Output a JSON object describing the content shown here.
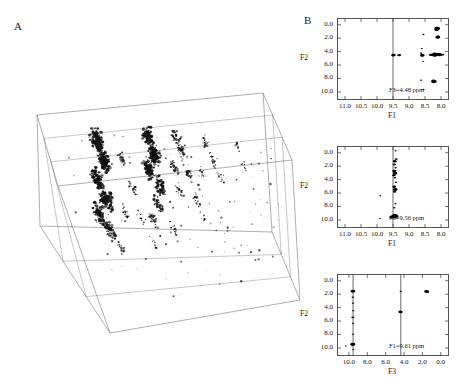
{
  "figure": {
    "panel_a_letter": "A",
    "panel_b_letter": "B"
  },
  "panelA": {
    "name": "3d-nmr-spectrum-cube",
    "description": "Three-dimensional NMR spectrum displayed as a perspective wireframe box with contour peak clusters"
  },
  "chart_data": [
    {
      "type": "scatter",
      "id": "plane-f3-4.48",
      "title": "F3=4.48 ppm",
      "xlabel": "F1",
      "ylabel": "F2",
      "xticks": [
        "11.0",
        "10.5",
        "10.0",
        "9.5",
        "9.0",
        "8.5",
        "8.0"
      ],
      "yticks": [
        "0.0",
        "2.0",
        "4.0",
        "6.0",
        "8.0",
        "10.0"
      ],
      "xlim": [
        11.25,
        7.75
      ],
      "ylim": [
        -1.0,
        11.2
      ],
      "grid": false,
      "vlines": [
        9.5
      ],
      "points": [
        {
          "x": 8.12,
          "y": 0.55,
          "s": 5.0
        },
        {
          "x": 8.14,
          "y": 0.75,
          "s": 4.2
        },
        {
          "x": 8.1,
          "y": 1.85,
          "s": 4.6
        },
        {
          "x": 8.55,
          "y": 1.45,
          "s": 2.0
        },
        {
          "x": 8.6,
          "y": 3.55,
          "s": 2.2
        },
        {
          "x": 8.62,
          "y": 4.25,
          "s": 2.4
        },
        {
          "x": 8.58,
          "y": 4.55,
          "s": 4.2
        },
        {
          "x": 8.56,
          "y": 5.45,
          "s": 2.0
        },
        {
          "x": 8.2,
          "y": 4.45,
          "s": 5.6
        },
        {
          "x": 8.05,
          "y": 4.45,
          "s": 5.0
        },
        {
          "x": 8.32,
          "y": 4.48,
          "s": 3.4
        },
        {
          "x": 7.95,
          "y": 4.45,
          "s": 3.0
        },
        {
          "x": 9.48,
          "y": 4.52,
          "s": 4.0
        },
        {
          "x": 9.3,
          "y": 4.52,
          "s": 3.4
        },
        {
          "x": 8.62,
          "y": 8.25,
          "s": 2.0
        },
        {
          "x": 8.22,
          "y": 8.45,
          "s": 5.2
        },
        {
          "x": 8.55,
          "y": 9.62,
          "s": 2.2
        }
      ]
    },
    {
      "type": "scatter",
      "id": "plane-f3-9.56",
      "title": "F3=9.56 ppm",
      "xlabel": "F1",
      "ylabel": "F2",
      "xticks": [
        "11.0",
        "10.5",
        "10.0",
        "9.5",
        "9.0",
        "8.5",
        "8.0"
      ],
      "yticks": [
        "0.0",
        "2.0",
        "4.0",
        "6.0",
        "8.0",
        "10.0"
      ],
      "xlim": [
        11.25,
        7.75
      ],
      "ylim": [
        -1.0,
        11.2
      ],
      "grid": false,
      "vlines": [
        9.5
      ],
      "points": [
        {
          "x": 9.42,
          "y": -0.3,
          "s": 1.8
        },
        {
          "x": 9.4,
          "y": 0.95,
          "s": 2.8
        },
        {
          "x": 9.44,
          "y": 1.3,
          "s": 3.6
        },
        {
          "x": 9.46,
          "y": 1.75,
          "s": 3.0
        },
        {
          "x": 9.42,
          "y": 2.25,
          "s": 2.4
        },
        {
          "x": 9.45,
          "y": 2.7,
          "s": 3.8
        },
        {
          "x": 9.43,
          "y": 3.05,
          "s": 4.0
        },
        {
          "x": 9.47,
          "y": 3.35,
          "s": 3.2
        },
        {
          "x": 9.44,
          "y": 3.7,
          "s": 2.6
        },
        {
          "x": 9.41,
          "y": 4.4,
          "s": 2.2
        },
        {
          "x": 9.46,
          "y": 5.05,
          "s": 3.4
        },
        {
          "x": 9.43,
          "y": 5.45,
          "s": 4.2
        },
        {
          "x": 9.45,
          "y": 5.8,
          "s": 3.0
        },
        {
          "x": 9.9,
          "y": 6.4,
          "s": 1.6
        },
        {
          "x": 9.42,
          "y": 7.6,
          "s": 2.0
        },
        {
          "x": 9.46,
          "y": 8.2,
          "s": 2.4
        },
        {
          "x": 9.44,
          "y": 9.45,
          "s": 6.4
        },
        {
          "x": 9.52,
          "y": 9.55,
          "s": 5.0
        },
        {
          "x": 9.9,
          "y": 9.8,
          "s": 1.8
        }
      ]
    },
    {
      "type": "scatter",
      "id": "plane-f1-9.61",
      "title": "F1=9.61 ppm",
      "xlabel": "F3",
      "ylabel": "F2",
      "xticks": [
        "10.0",
        "8.0",
        "6.0",
        "4.0",
        "2.0",
        "0.0"
      ],
      "yticks": [
        "0.0",
        "2.0",
        "4.0",
        "6.0",
        "8.0",
        "10.0"
      ],
      "xlim": [
        11.3,
        -0.9
      ],
      "ylim": [
        -1.0,
        11.2
      ],
      "grid": false,
      "vlines": [
        9.55,
        4.35
      ],
      "points": [
        {
          "x": 9.55,
          "y": 1.55,
          "s": 4.0
        },
        {
          "x": 9.58,
          "y": 2.45,
          "s": 2.4
        },
        {
          "x": 9.56,
          "y": 3.35,
          "s": 2.0
        },
        {
          "x": 9.54,
          "y": 4.45,
          "s": 2.2
        },
        {
          "x": 9.57,
          "y": 5.45,
          "s": 3.0
        },
        {
          "x": 9.55,
          "y": 6.35,
          "s": 2.0
        },
        {
          "x": 9.56,
          "y": 7.95,
          "s": 2.2
        },
        {
          "x": 9.58,
          "y": 9.45,
          "s": 4.6
        },
        {
          "x": 10.35,
          "y": 9.7,
          "s": 1.8
        },
        {
          "x": 9.52,
          "y": 10.25,
          "s": 2.0
        },
        {
          "x": 4.35,
          "y": 1.6,
          "s": 2.2
        },
        {
          "x": 4.38,
          "y": 4.65,
          "s": 4.0
        },
        {
          "x": 1.55,
          "y": 1.6,
          "s": 4.4
        }
      ]
    }
  ]
}
